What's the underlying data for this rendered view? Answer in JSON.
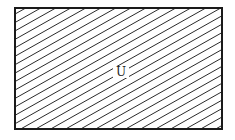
{
  "diagram": {
    "type": "venn",
    "universal_set": {
      "label": "U",
      "shape": "rectangle",
      "shaded": true,
      "shading": "diagonal-hatch"
    },
    "colors": {
      "stroke": "#1a1a1a",
      "hatch": "#2a2a2a",
      "background": "#ffffff"
    }
  }
}
